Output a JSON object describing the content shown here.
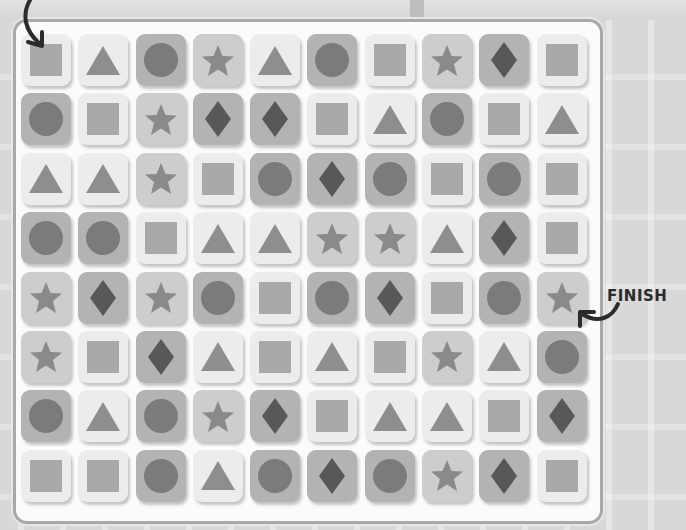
{
  "puzzle": {
    "start_label": "",
    "finish_label": "FINISH",
    "columns": 10,
    "rows": 8,
    "start_cell": [
      0,
      0
    ],
    "finish_cell": [
      4,
      9
    ],
    "grid": [
      [
        {
          "shape": "square",
          "tone": "light"
        },
        {
          "shape": "triangle",
          "tone": "light"
        },
        {
          "shape": "circle",
          "tone": "dark"
        },
        {
          "shape": "star",
          "tone": "mid"
        },
        {
          "shape": "triangle",
          "tone": "light"
        },
        {
          "shape": "circle",
          "tone": "dark"
        },
        {
          "shape": "square",
          "tone": "light"
        },
        {
          "shape": "star",
          "tone": "mid"
        },
        {
          "shape": "diamond",
          "tone": "dark"
        },
        {
          "shape": "square",
          "tone": "light"
        }
      ],
      [
        {
          "shape": "circle",
          "tone": "dark"
        },
        {
          "shape": "square",
          "tone": "light"
        },
        {
          "shape": "star",
          "tone": "mid"
        },
        {
          "shape": "diamond",
          "tone": "dark"
        },
        {
          "shape": "diamond",
          "tone": "dark"
        },
        {
          "shape": "square",
          "tone": "light"
        },
        {
          "shape": "triangle",
          "tone": "light"
        },
        {
          "shape": "circle",
          "tone": "dark"
        },
        {
          "shape": "square",
          "tone": "light"
        },
        {
          "shape": "triangle",
          "tone": "light"
        }
      ],
      [
        {
          "shape": "triangle",
          "tone": "light"
        },
        {
          "shape": "triangle",
          "tone": "light"
        },
        {
          "shape": "star",
          "tone": "mid"
        },
        {
          "shape": "square",
          "tone": "light"
        },
        {
          "shape": "circle",
          "tone": "dark"
        },
        {
          "shape": "diamond",
          "tone": "dark"
        },
        {
          "shape": "circle",
          "tone": "dark"
        },
        {
          "shape": "square",
          "tone": "light"
        },
        {
          "shape": "circle",
          "tone": "dark"
        },
        {
          "shape": "square",
          "tone": "light"
        }
      ],
      [
        {
          "shape": "circle",
          "tone": "dark"
        },
        {
          "shape": "circle",
          "tone": "dark"
        },
        {
          "shape": "square",
          "tone": "light"
        },
        {
          "shape": "triangle",
          "tone": "light"
        },
        {
          "shape": "triangle",
          "tone": "light"
        },
        {
          "shape": "star",
          "tone": "mid"
        },
        {
          "shape": "star",
          "tone": "mid"
        },
        {
          "shape": "triangle",
          "tone": "light"
        },
        {
          "shape": "diamond",
          "tone": "dark"
        },
        {
          "shape": "square",
          "tone": "light"
        }
      ],
      [
        {
          "shape": "star",
          "tone": "mid"
        },
        {
          "shape": "diamond",
          "tone": "dark"
        },
        {
          "shape": "star",
          "tone": "mid"
        },
        {
          "shape": "circle",
          "tone": "dark"
        },
        {
          "shape": "square",
          "tone": "light"
        },
        {
          "shape": "circle",
          "tone": "dark"
        },
        {
          "shape": "diamond",
          "tone": "dark"
        },
        {
          "shape": "square",
          "tone": "light"
        },
        {
          "shape": "circle",
          "tone": "dark"
        },
        {
          "shape": "star",
          "tone": "mid"
        }
      ],
      [
        {
          "shape": "star",
          "tone": "mid"
        },
        {
          "shape": "square",
          "tone": "light"
        },
        {
          "shape": "diamond",
          "tone": "dark"
        },
        {
          "shape": "triangle",
          "tone": "light"
        },
        {
          "shape": "square",
          "tone": "light"
        },
        {
          "shape": "triangle",
          "tone": "light"
        },
        {
          "shape": "square",
          "tone": "light"
        },
        {
          "shape": "star",
          "tone": "mid"
        },
        {
          "shape": "triangle",
          "tone": "light"
        },
        {
          "shape": "circle",
          "tone": "dark"
        }
      ],
      [
        {
          "shape": "circle",
          "tone": "dark"
        },
        {
          "shape": "triangle",
          "tone": "light"
        },
        {
          "shape": "circle",
          "tone": "dark"
        },
        {
          "shape": "star",
          "tone": "mid"
        },
        {
          "shape": "diamond",
          "tone": "dark"
        },
        {
          "shape": "square",
          "tone": "light"
        },
        {
          "shape": "triangle",
          "tone": "light"
        },
        {
          "shape": "triangle",
          "tone": "light"
        },
        {
          "shape": "square",
          "tone": "light"
        },
        {
          "shape": "diamond",
          "tone": "dark"
        }
      ],
      [
        {
          "shape": "square",
          "tone": "light"
        },
        {
          "shape": "square",
          "tone": "light"
        },
        {
          "shape": "circle",
          "tone": "dark"
        },
        {
          "shape": "triangle",
          "tone": "light"
        },
        {
          "shape": "circle",
          "tone": "dark"
        },
        {
          "shape": "diamond",
          "tone": "dark"
        },
        {
          "shape": "circle",
          "tone": "dark"
        },
        {
          "shape": "star",
          "tone": "mid"
        },
        {
          "shape": "diamond",
          "tone": "dark"
        },
        {
          "shape": "square",
          "tone": "light"
        }
      ]
    ]
  },
  "icons": {
    "start": "curved-arrow-down-icon",
    "finish": "curved-arrow-left-icon"
  },
  "colors": {
    "background": "#d8d8d8",
    "panel": "#fbfbfb",
    "panel_border": "#a8a8a8",
    "tile_light": "#ececec",
    "tile_mid": "#cdcdcd",
    "tile_dark": "#b3b3b3",
    "square": "#a9a9a9",
    "triangle": "#8e8e8e",
    "circle": "#7b7b7b",
    "star": "#8a8a8a",
    "diamond": "#585858",
    "arrow": "#2b2b2b"
  }
}
